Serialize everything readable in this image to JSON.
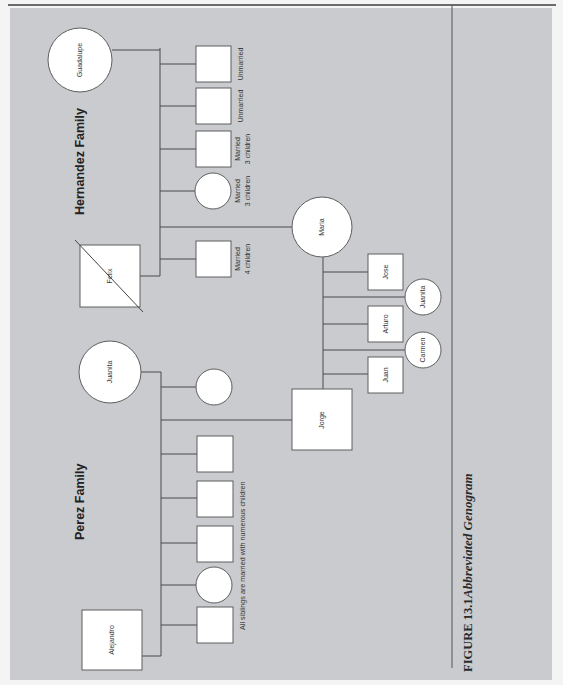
{
  "figure": {
    "number": "FIGURE 13.1",
    "title": "Abbreviated Genogram"
  },
  "families": {
    "hernandez": {
      "title": "Hernandez Family",
      "father": {
        "name": "Felix",
        "shape": "square",
        "deceased": true
      },
      "mother": {
        "name": "Guadalupe",
        "shape": "circle"
      },
      "children": [
        {
          "shape": "square",
          "note_line1": "Unmarried",
          "note_line2": ""
        },
        {
          "shape": "square",
          "note_line1": "Unmarried",
          "note_line2": ""
        },
        {
          "shape": "square",
          "note_line1": "Married",
          "note_line2": "3 children"
        },
        {
          "shape": "circle",
          "note_line1": "Married",
          "note_line2": "3 children"
        },
        {
          "name": "Maria",
          "shape": "circle"
        },
        {
          "shape": "square",
          "note_line1": "Married",
          "note_line2": "4 children"
        }
      ]
    },
    "perez": {
      "title": "Perez Family",
      "father": {
        "name": "Alejandro",
        "shape": "square"
      },
      "mother": {
        "name": "Juanita",
        "shape": "circle"
      },
      "children": [
        {
          "shape": "circle"
        },
        {
          "name": "Jorge",
          "shape": "square"
        },
        {
          "shape": "square"
        },
        {
          "shape": "square"
        },
        {
          "shape": "square"
        },
        {
          "shape": "circle"
        },
        {
          "shape": "square"
        }
      ],
      "siblings_note": "All siblings are married with numerous children"
    },
    "jorge_maria": {
      "children": [
        {
          "name": "Jose",
          "shape": "square"
        },
        {
          "name": "Juanita",
          "shape": "circle"
        },
        {
          "name": "Arturo",
          "shape": "square"
        },
        {
          "name": "Carmen",
          "shape": "circle"
        },
        {
          "name": "Juan",
          "shape": "square"
        }
      ]
    }
  },
  "colors": {
    "panel": "#c9cbce",
    "node_fill": "#ffffff",
    "line": "#4a4a4a"
  }
}
